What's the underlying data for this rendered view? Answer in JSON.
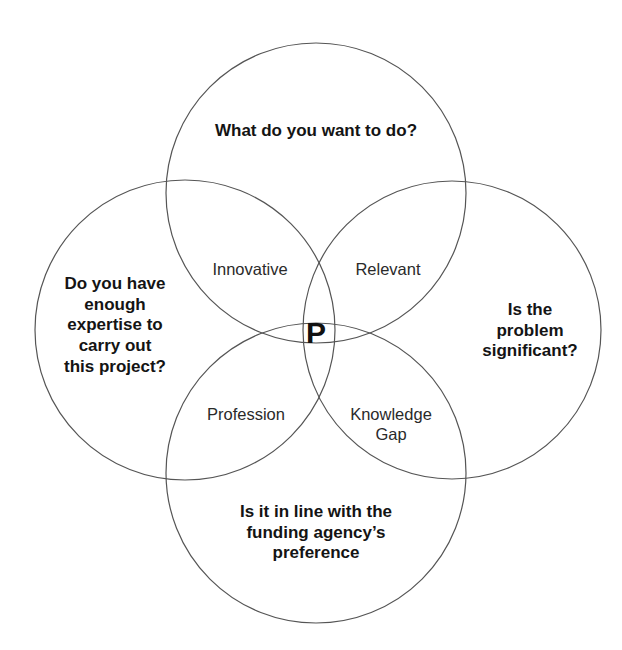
{
  "diagram": {
    "type": "venn",
    "circles": [
      {
        "id": "top",
        "cx": 316,
        "cy": 193,
        "r": 150,
        "label": "What do you want to do?"
      },
      {
        "id": "left",
        "cx": 185,
        "cy": 330,
        "r": 150,
        "label": "Do you have\nenough\nexpertise to\ncarry out\nthis project?"
      },
      {
        "id": "right",
        "cx": 452,
        "cy": 330,
        "r": 149,
        "label": "Is the\nproblem\nsignificant?"
      },
      {
        "id": "bottom",
        "cx": 316,
        "cy": 473,
        "r": 150,
        "label": "Is it in line with the\nfunding agency’s\npreference"
      }
    ],
    "intersections": {
      "top_left": "Innovative",
      "top_right": "Relevant",
      "bottom_left": "Profession",
      "bottom_right": "Knowledge\nGap",
      "center": "P"
    },
    "stroke_color": "#555555"
  }
}
